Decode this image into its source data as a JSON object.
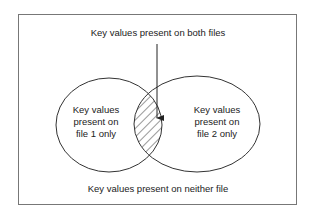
{
  "diagram": {
    "type": "venn",
    "labels": {
      "both": "Key values present on both files",
      "file1_only": [
        "Key values",
        "present on",
        "file 1 only"
      ],
      "file2_only": [
        "Key values",
        "present on",
        "file 2 only"
      ],
      "neither": "Key values present on neither file"
    },
    "sets": [
      {
        "name": "file 1",
        "label": "Key values present on file 1 only"
      },
      {
        "name": "file 2",
        "label": "Key values present on file 2 only"
      }
    ],
    "intersection": {
      "label": "Key values present on both files",
      "style": "hatched"
    },
    "colors": {
      "stroke": "#333333",
      "frame": "#777777",
      "background": "#ffffff"
    }
  }
}
